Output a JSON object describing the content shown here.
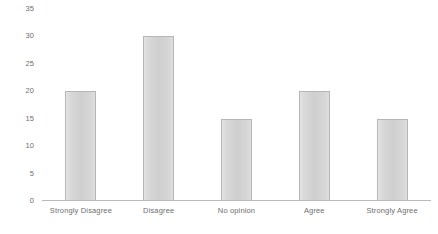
{
  "chart_data": {
    "type": "bar",
    "title": "",
    "subtitle": "",
    "xlabel": "",
    "ylabel": "",
    "categories": [
      "Strongly Disagree",
      "Disagree",
      "No opinion",
      "Agree",
      "Strongly Agree"
    ],
    "values": [
      20,
      30,
      15,
      20,
      15
    ],
    "ylim": [
      0,
      35
    ],
    "yticks": [
      0,
      5,
      10,
      15,
      20,
      25,
      30,
      35
    ],
    "ytick_labels": [
      "0",
      "5",
      "10",
      "15",
      "20",
      "25",
      "30",
      "35"
    ],
    "grid": false,
    "legend": false,
    "legend_position": "none",
    "bar_fill_color": "#d4d4d4",
    "bar_border_color": "#b6b6b6",
    "axis_color": "#b9b9b9",
    "tick_label_color": "#6e6e6e",
    "background_color": "#ffffff"
  }
}
